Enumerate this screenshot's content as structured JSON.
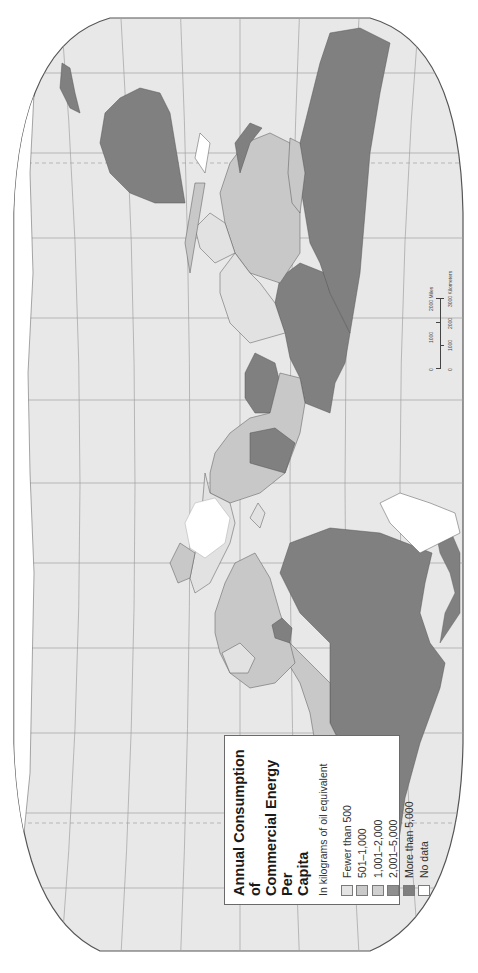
{
  "map": {
    "title": "Annual Consumption of Commercial Energy Per Capita",
    "title_lines": [
      "Annual Consumption of",
      "Commercial Energy Per",
      "Capita"
    ],
    "units": "In kilograms of oil equivalent",
    "orientation": "rotated 90° counter-clockwise (landscape page)",
    "projection_background": "#e6e6e6",
    "frame_color": "#555555"
  },
  "legend": {
    "items": [
      {
        "label": "Fewer than 500",
        "color": "#e4e4e4"
      },
      {
        "label": "501–1,000",
        "color": "#c9c9c9"
      },
      {
        "label": "1,001–2,000",
        "color": "#d0d0d0"
      },
      {
        "label": "2,001–5,000",
        "color": "#8f8f8f"
      },
      {
        "label": "More than 5,000",
        "color": "#7f7f7f"
      },
      {
        "label": "No data",
        "color": "#ffffff"
      }
    ]
  },
  "scale_bar": {
    "miles": {
      "labels": [
        "0",
        "1000",
        "2000 Miles"
      ]
    },
    "kilometers": {
      "labels": [
        "0",
        "1000",
        "2000",
        "3000 Kilometers"
      ]
    }
  },
  "colors": {
    "ocean": "#e8e8e8",
    "graticule": "#9a9a9a",
    "high": "#808080",
    "mid_high": "#8f8f8f",
    "mid": "#c8c8c8",
    "low": "#e2e2e2",
    "nodata": "#ffffff"
  }
}
